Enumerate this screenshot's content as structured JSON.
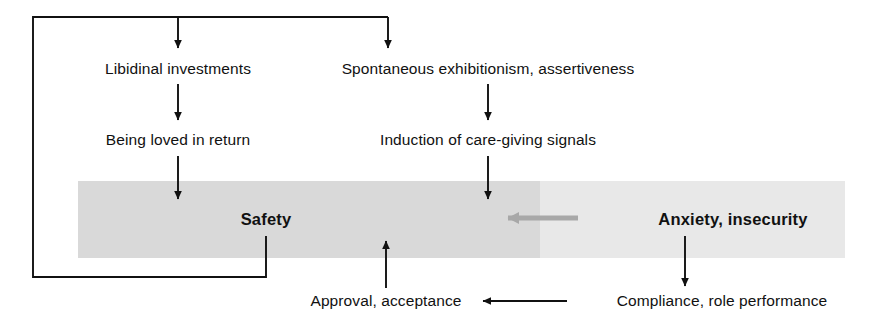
{
  "diagram": {
    "colors": {
      "ink": "#111111",
      "band_left": "#d9d9d9",
      "band_right": "#e8e8e8",
      "gray_arrow": "#a8a8a8",
      "background": "#ffffff"
    },
    "nodes": [
      {
        "id": "libidinal-investments",
        "label": "Libidinal investments",
        "x": 178,
        "y": 69,
        "bold": false
      },
      {
        "id": "spontaneous-exhibitionism",
        "label": "Spontaneous exhibitionism, assertiveness",
        "x": 488,
        "y": 69,
        "bold": false
      },
      {
        "id": "being-loved-in-return",
        "label": "Being loved in return",
        "x": 178,
        "y": 140,
        "bold": false
      },
      {
        "id": "induction-of-care-giving-signals",
        "label": "Induction of care-giving signals",
        "x": 488,
        "y": 140,
        "bold": false
      },
      {
        "id": "safety",
        "label": "Safety",
        "x": 266,
        "y": 219,
        "bold": true
      },
      {
        "id": "anxiety-insecurity",
        "label": "Anxiety, insecurity",
        "x": 733,
        "y": 219,
        "bold": true
      },
      {
        "id": "approval-acceptance",
        "label": "Approval, acceptance",
        "x": 386,
        "y": 301,
        "bold": false
      },
      {
        "id": "compliance-role-performance",
        "label": "Compliance, role performance",
        "x": 722,
        "y": 301,
        "bold": false
      }
    ],
    "bands": [
      {
        "id": "safety-band-left",
        "x": 78,
        "y": 181,
        "width": 462,
        "height": 77,
        "fill": "#d9d9d9"
      },
      {
        "id": "anxiety-band-right",
        "x": 540,
        "y": 181,
        "width": 305,
        "height": 77,
        "fill": "#e8e8e8"
      }
    ],
    "connectors": [
      {
        "id": "feedback-loop-safety-to-top",
        "description": "Safety feeds back up the left side to both top branches",
        "points": "266,236 266,277 33,277 33,17 388,17",
        "arrowheads": [
          "178,17-down",
          "388,17-down"
        ]
      },
      {
        "id": "libidinal-to-being-loved",
        "description": "Libidinal investments to Being loved in return",
        "points": "178,84 178,124"
      },
      {
        "id": "being-loved-to-safety",
        "description": "Being loved in return to Safety band",
        "points": "178,156 178,199"
      },
      {
        "id": "spontaneous-to-induction",
        "description": "Spontaneous exhibitionism to Induction of care-giving signals",
        "points": "488,84 488,124"
      },
      {
        "id": "induction-to-safety-band",
        "description": "Induction of care-giving signals into the band",
        "points": "488,156 488,199"
      },
      {
        "id": "anxiety-to-safety-gray",
        "description": "Gray arrow from Anxiety, insecurity toward Safety",
        "points": "578,218 498,218",
        "color": "#a8a8a8"
      },
      {
        "id": "anxiety-to-compliance",
        "description": "Anxiety, insecurity down to Compliance, role performance",
        "points": "685,236 685,288"
      },
      {
        "id": "compliance-to-approval",
        "description": "Compliance, role performance left to Approval, acceptance",
        "points": "567,301 479,301"
      },
      {
        "id": "approval-to-band",
        "description": "Approval, acceptance up into the band",
        "points": "386,288 386,240"
      }
    ]
  }
}
